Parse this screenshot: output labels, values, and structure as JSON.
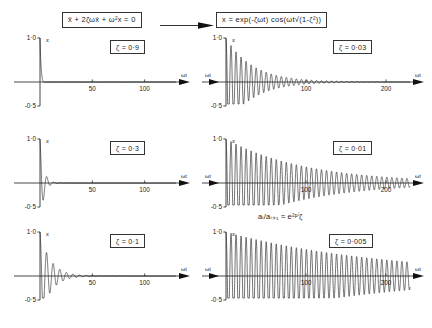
{
  "figure": {
    "equations": {
      "ode": "ẍ + 2ζωẋ + ω²x = 0",
      "solution": "x = exp(-ζωt) cos(ωt√(1-ζ²))"
    },
    "arrow_icon": "right-arrow-icon",
    "annotation": "aᵢ/aᵢ₊₁ ≈ e²ᵖⁱζ"
  },
  "axes": {
    "y_label": "x",
    "y_top_tick": "1·0",
    "y_bottom_tick": "-0·5",
    "x_label_right": "ωt",
    "left_ticks": [
      "50",
      "100"
    ],
    "right_ticks": [
      "100",
      "200"
    ]
  },
  "chart_data": {
    "type": "line",
    "xlabel": "ωt",
    "ylabel": "x",
    "grid": false,
    "legend": "none",
    "equation_ode": "ẍ + 2ζωẋ + ω²x = 0",
    "equation_solution": "x = exp(-ζωt) cos(ωt√(1-ζ²))",
    "annotation": "aᵢ/aᵢ₊₁ ≈ e^(2πζ)",
    "ylim": [
      -0.5,
      1.0
    ],
    "panels": [
      {
        "id": "top-left",
        "zeta_label": "ζ = 0·9",
        "zeta": 0.9,
        "xlim": [
          0,
          130
        ],
        "xticks": [
          50,
          100
        ],
        "yticks": [
          1.0,
          -0.5
        ],
        "series": [
          {
            "name": "x(ωt)",
            "formula": "exp(-0.9*t)*cos(0.43589*t)"
          }
        ]
      },
      {
        "id": "middle-left",
        "zeta_label": "ζ = 0·3",
        "zeta": 0.3,
        "xlim": [
          0,
          130
        ],
        "xticks": [
          50,
          100
        ],
        "yticks": [
          1.0,
          -0.5
        ],
        "series": [
          {
            "name": "x(ωt)",
            "formula": "exp(-0.3*t)*cos(0.95394*t)"
          }
        ]
      },
      {
        "id": "bottom-left",
        "zeta_label": "ζ = 0·1",
        "zeta": 0.1,
        "xlim": [
          0,
          130
        ],
        "xticks": [
          50,
          100
        ],
        "yticks": [
          1.0,
          -0.5
        ],
        "series": [
          {
            "name": "x(ωt)",
            "formula": "exp(-0.1*t)*cos(0.99499*t)"
          }
        ]
      },
      {
        "id": "top-right",
        "zeta_label": "ζ = 0·03",
        "zeta": 0.03,
        "xlim": [
          0,
          230
        ],
        "xticks": [
          100,
          200
        ],
        "yticks": [
          1.0,
          -0.5
        ],
        "series": [
          {
            "name": "x(ωt)",
            "formula": "exp(-0.03*t)*cos(0.99955*t)"
          }
        ]
      },
      {
        "id": "middle-right",
        "zeta_label": "ζ = 0·01",
        "zeta": 0.01,
        "xlim": [
          0,
          230
        ],
        "xticks": [
          100,
          200
        ],
        "yticks": [
          1.0,
          -0.5
        ],
        "series": [
          {
            "name": "x(ωt)",
            "formula": "exp(-0.01*t)*cos(0.99995*t)"
          }
        ]
      },
      {
        "id": "bottom-right",
        "zeta_label": "ζ = 0·005",
        "zeta": 0.005,
        "xlim": [
          0,
          230
        ],
        "xticks": [
          100,
          200
        ],
        "yticks": [
          1.0,
          -0.5
        ],
        "series": [
          {
            "name": "x(ωt)",
            "formula": "exp(-0.005*t)*cos(0.99999*t)"
          }
        ]
      }
    ]
  }
}
